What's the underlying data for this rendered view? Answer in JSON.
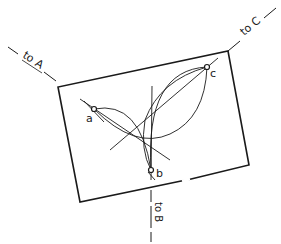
{
  "diagram": {
    "labels": {
      "to_a": "to A",
      "to_b": "to B",
      "to_c": "to C",
      "point_a": "a",
      "point_b": "b",
      "point_c": "c"
    },
    "points": {
      "a": [
        94,
        109
      ],
      "b": [
        151,
        170
      ],
      "c": [
        207,
        67
      ]
    },
    "sheet_corners": [
      [
        58,
        87
      ],
      [
        228,
        51
      ],
      [
        249,
        165
      ],
      [
        80,
        202
      ]
    ],
    "colors": {
      "ink": "#1a1a1a",
      "background": "#ffffff"
    }
  }
}
